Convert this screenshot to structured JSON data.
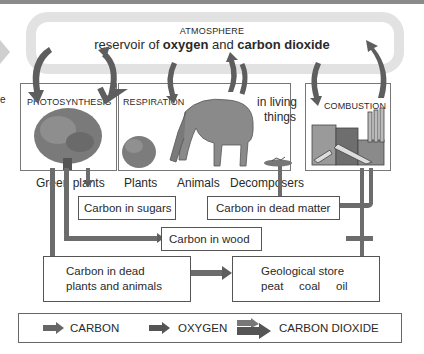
{
  "atmosphere": {
    "title": "ATMOSPHERE",
    "subtitle_prefix": "reservoir of ",
    "subtitle_oxygen": "oxygen",
    "subtitle_mid": " and ",
    "subtitle_co2": "carbon dioxide"
  },
  "left_edge_text": "e",
  "processes": {
    "photosynthesis": "PHOTOSYNTHESIS",
    "respiration": "RESPIRATION",
    "respiration_note_line1": "in living",
    "respiration_note_line2": "things",
    "combustion": "COMBUSTION"
  },
  "organisms": {
    "green_plants": "Green plants",
    "plants": "Plants",
    "animals": "Animals",
    "decomposers": "Decomposers"
  },
  "stores": {
    "sugars": "Carbon in sugars",
    "dead_matter": "Carbon in dead matter",
    "wood": "Carbon in wood",
    "dead_plants_animals_line1": "Carbon in dead",
    "dead_plants_animals_line2": "plants and animals",
    "geological_line1": "Geological store",
    "geological_peat": "peat",
    "geological_coal": "coal",
    "geological_oil": "oil"
  },
  "legend": {
    "carbon": "CARBON",
    "oxygen": "OXYGEN",
    "carbon_dioxide": "CARBON DIOXIDE"
  },
  "colors": {
    "arrow": "#5e5e5e",
    "atmosphere_band": "#e2e2e2",
    "box_border": "#555555"
  }
}
